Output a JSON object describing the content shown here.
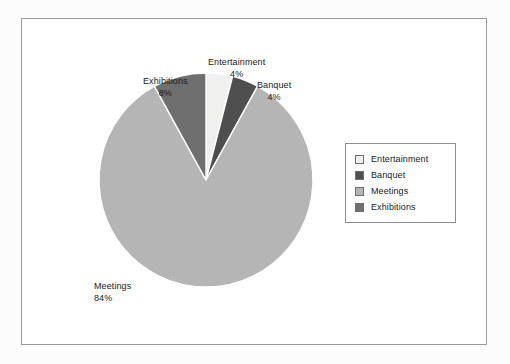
{
  "figure": {
    "background_color": "#ffffff",
    "frame_border_color": "#9a9a9a"
  },
  "legend": {
    "border_color": "#8d8d8d",
    "position": "right",
    "items": [
      {
        "label": "Entertainment",
        "color": "#f0f0ef"
      },
      {
        "label": "Banquet",
        "color": "#4f4f4f"
      },
      {
        "label": "Meetings",
        "color": "#b5b5b5"
      },
      {
        "label": "Exhibitions",
        "color": "#6f6f6f"
      }
    ]
  },
  "callouts": [
    {
      "name": "Entertainment",
      "value": "4%"
    },
    {
      "name": "Exhibitions",
      "value": "8%"
    },
    {
      "name": "Banquet",
      "value": "4%"
    },
    {
      "name": "Meetings",
      "value": "84%"
    }
  ],
  "chart_data": {
    "type": "pie",
    "title": "",
    "subtitle": "",
    "labels": [
      "Entertainment",
      "Banquet",
      "Meetings",
      "Exhibitions"
    ],
    "values": [
      4,
      4,
      84,
      8
    ],
    "unit": "%",
    "value_labels": [
      "4%",
      "4%",
      "84%",
      "8%"
    ],
    "colors": [
      "#f0f0ef",
      "#4f4f4f",
      "#b5b5b5",
      "#6f6f6f"
    ],
    "start_angle_deg": 0,
    "direction": "clockwise",
    "legend_position": "right",
    "legend_entries": [
      "Entertainment",
      "Banquet",
      "Meetings",
      "Exhibitions"
    ],
    "annotations": [
      "Entertainment 4%",
      "Banquet 4%",
      "Meetings 84%",
      "Exhibitions 8%"
    ],
    "grid": false,
    "xlabel": "",
    "ylabel": ""
  },
  "geometry": {
    "center_x": 184,
    "center_y": 161,
    "radius": 107
  }
}
